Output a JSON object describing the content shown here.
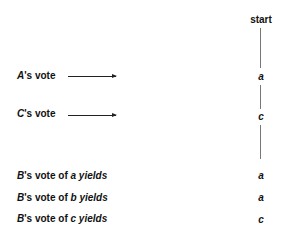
{
  "diagram": {
    "tree": {
      "root": "start",
      "nodes": [
        "a",
        "c"
      ]
    },
    "left_labels": [
      {
        "player": "A",
        "suffix": "'s vote"
      },
      {
        "player": "C",
        "suffix": "'s vote"
      }
    ],
    "outcomes": [
      {
        "player": "B",
        "mid": "'s vote of ",
        "choice": "a",
        "end": " yields",
        "result": "a"
      },
      {
        "player": "B",
        "mid": "'s vote of ",
        "choice": "b",
        "end": " yields",
        "result": "a"
      },
      {
        "player": "B",
        "mid": "'s vote of ",
        "choice": "c",
        "end": " yields",
        "result": "c"
      }
    ]
  }
}
